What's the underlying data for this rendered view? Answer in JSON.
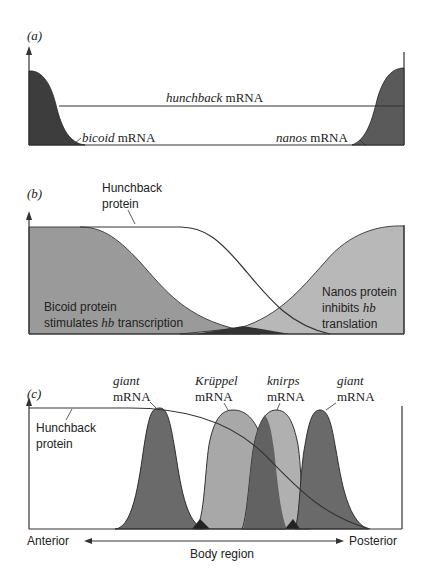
{
  "figure": {
    "panels": [
      {
        "id": "a",
        "label": "(a)",
        "labels": {
          "hunchback": {
            "italic": "hunchback",
            "rest": " mRNA"
          },
          "bicoid": {
            "italic": "bicoid",
            "rest": " mRNA"
          },
          "nanos": {
            "italic": "nanos",
            "rest": " mRNA"
          }
        }
      },
      {
        "id": "b",
        "label": "(b)",
        "labels": {
          "hunchback_line1": "Hunchback",
          "hunchback_line2": "protein",
          "bicoid_line1": "Bicoid protein",
          "bicoid_line2_pre": "stimulates ",
          "bicoid_line2_it": "hb",
          "bicoid_line2_post": " transcription",
          "nanos_line1": "Nanos protein",
          "nanos_line2_pre": "inhibits ",
          "nanos_line2_it": "hb",
          "nanos_line3": "translation"
        }
      },
      {
        "id": "c",
        "label": "(c)",
        "labels": {
          "hunchback_line1": "Hunchback",
          "hunchback_line2": "protein",
          "giant1_it": "giant",
          "giant1_rest": "mRNA",
          "kruppel_it": "Krüppel",
          "kruppel_rest": "mRNA",
          "knirps_it": "knirps",
          "knirps_rest": "mRNA",
          "giant2_it": "giant",
          "giant2_rest": "mRNA"
        },
        "axis": {
          "left": "Anterior",
          "right": "Posterior",
          "title": "Body region"
        }
      }
    ],
    "colors": {
      "dark_fill": "#3a3a3a",
      "mid_fill": "#6e6e6e",
      "light_fill": "#a8a8a8",
      "protein_fill": "#9a9a9a",
      "nanos_fill": "#b5b5b5",
      "line": "#333333"
    }
  }
}
